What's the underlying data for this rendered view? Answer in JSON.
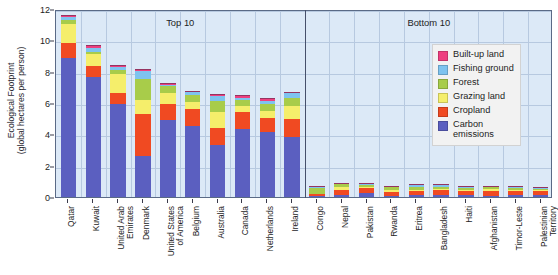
{
  "chart_data": {
    "type": "bar",
    "subtype": "stacked-bar",
    "title": "",
    "xlabel": "",
    "ylabel": "Ecological Footprint (global hectares per person)",
    "ylabel_line1": "Ecological Footprint",
    "ylabel_line2": "(global hectares per person)",
    "ylim": [
      0,
      12
    ],
    "yticks": [
      0,
      2,
      4,
      6,
      8,
      10,
      12
    ],
    "ytick_labels": [
      "0",
      "2",
      "4",
      "6",
      "8",
      "10",
      "12"
    ],
    "grid": true,
    "legend_position": "upper right",
    "panels": [
      {
        "name": "top10",
        "label": "Top 10"
      },
      {
        "name": "bottom10",
        "label": "Bottom 10"
      }
    ],
    "series": [
      {
        "name": "Carbon emissions",
        "color": "#5b5fc0",
        "values": [
          8.85,
          7.65,
          5.95,
          2.6,
          4.9,
          4.55,
          3.35,
          4.35,
          4.15,
          3.8,
          0.05,
          0.12,
          0.26,
          0.07,
          0.1,
          0.16,
          0.1,
          0.09,
          0.14,
          0.12
        ]
      },
      {
        "name": "Cropland",
        "color": "#f04a22",
        "values": [
          0.95,
          0.7,
          0.72,
          2.7,
          1.05,
          1.1,
          1.05,
          1.1,
          0.92,
          1.15,
          0.12,
          0.33,
          0.3,
          0.26,
          0.28,
          0.32,
          0.3,
          0.3,
          0.26,
          0.26
        ]
      },
      {
        "name": "Grazing land",
        "color": "#f5ee6b",
        "values": [
          1.25,
          0.75,
          1.2,
          0.92,
          0.66,
          0.42,
          1.0,
          0.35,
          0.45,
          0.85,
          0.05,
          0.2,
          0.1,
          0.12,
          0.08,
          0.05,
          0.06,
          0.14,
          0.06,
          0.06
        ]
      },
      {
        "name": "Forest",
        "color": "#a8cc4a",
        "values": [
          0.25,
          0.18,
          0.25,
          1.3,
          0.45,
          0.45,
          0.75,
          0.38,
          0.42,
          0.55,
          0.38,
          0.18,
          0.12,
          0.2,
          0.2,
          0.1,
          0.12,
          0.1,
          0.1,
          0.08
        ]
      },
      {
        "name": "Fishing ground",
        "color": "#7ec3ef",
        "values": [
          0.18,
          0.22,
          0.15,
          0.5,
          0.1,
          0.16,
          0.3,
          0.16,
          0.2,
          0.26,
          0.02,
          0.02,
          0.04,
          0.02,
          0.1,
          0.12,
          0.04,
          0.02,
          0.08,
          0.04
        ]
      },
      {
        "name": "Built-up land",
        "color": "#ee3f80",
        "values": [
          0.12,
          0.18,
          0.13,
          0.18,
          0.14,
          0.12,
          0.15,
          0.16,
          0.16,
          0.09,
          0.02,
          0.03,
          0.04,
          0.03,
          0.03,
          0.04,
          0.03,
          0.03,
          0.03,
          0.03
        ]
      }
    ],
    "categories": [
      "Qatar",
      "Kuwait",
      "United Arab Emirates",
      "Denmark",
      "United States of America",
      "Belgium",
      "Australia",
      "Canada",
      "Netherlands",
      "Ireland",
      "Congo",
      "Nepal",
      "Pakistan",
      "Rwanda",
      "Eritrea",
      "Bangladesh",
      "Haiti",
      "Afghanistan",
      "Timor-Leste",
      "Palestinian Territory"
    ],
    "category_lines": [
      [
        "Qatar"
      ],
      [
        "Kuwait"
      ],
      [
        "United Arab",
        "Emirates"
      ],
      [
        "Denmark"
      ],
      [
        "United States",
        "of America"
      ],
      [
        "Belgium"
      ],
      [
        "Australia"
      ],
      [
        "Canada"
      ],
      [
        "Netherlands"
      ],
      [
        "Ireland"
      ],
      [
        "Congo"
      ],
      [
        "Nepal"
      ],
      [
        "Pakistan"
      ],
      [
        "Rwanda"
      ],
      [
        "Eritrea"
      ],
      [
        "Bangladesh"
      ],
      [
        "Haiti"
      ],
      [
        "Afghanistan"
      ],
      [
        "Timor-Leste"
      ],
      [
        "Palestinian",
        "Territory"
      ]
    ],
    "totals": [
      11.6,
      9.68,
      8.4,
      8.2,
      7.3,
      6.8,
      6.6,
      6.5,
      6.3,
      6.7,
      0.64,
      0.88,
      0.86,
      0.7,
      0.79,
      0.79,
      0.65,
      0.68,
      0.67,
      0.59
    ]
  },
  "legend": {
    "entries": [
      {
        "label": "Built-up land",
        "color": "#ee3f80"
      },
      {
        "label": "Fishing ground",
        "color": "#7ec3ef"
      },
      {
        "label": "Forest",
        "color": "#a8cc4a"
      },
      {
        "label": "Grazing land",
        "color": "#f5ee6b"
      },
      {
        "label": "Cropland",
        "color": "#f04a22"
      },
      {
        "label": "Carbon\nemissions",
        "color": "#5b5fc0"
      }
    ]
  },
  "colors": {
    "plot_background": "#dce9f7",
    "gridline": "#b7c9e0",
    "axis": "#46506b",
    "legend_background": "#f2f2f2"
  }
}
